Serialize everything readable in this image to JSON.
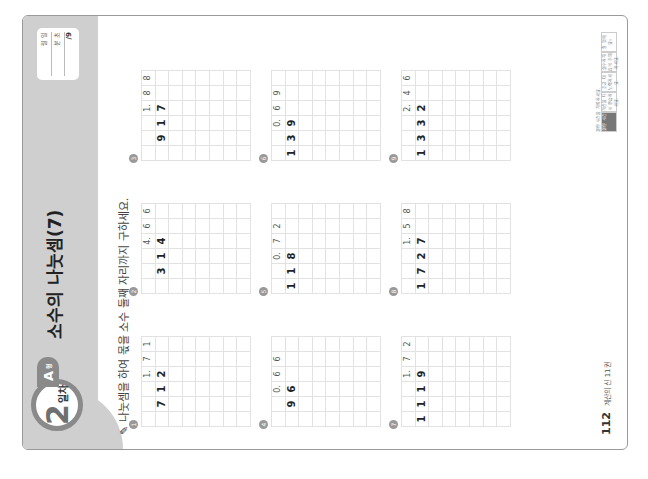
{
  "header": {
    "day_number": "2",
    "day_label": "일차",
    "type_letter": "A",
    "type_suffix": "형",
    "title": "소수의 나눗셈(7)",
    "scorebox": {
      "date_label": "월   일",
      "time_label": "분   초",
      "score": "/9"
    }
  },
  "instruction": "나눗셈을 하여 몫을 소수 둘째 자리까지 구하세요.",
  "problems": [
    {
      "number": "1",
      "divisor": "7",
      "dividend": "12",
      "quotient": "1.71",
      "work": [
        "1. 7 1",
        "7)1 2",
        "  7",
        "  5 0",
        "  4 9",
        "    1 0",
        "      7",
        "      3"
      ]
    },
    {
      "number": "2",
      "divisor": "3",
      "dividend": "14",
      "quotient": "4.66",
      "work": [
        "4. 6 6",
        "3)1 4",
        "1 2",
        "  2 0",
        "  1 8",
        "    2 0",
        "    1 8",
        "      2"
      ]
    },
    {
      "number": "3",
      "divisor": "9",
      "dividend": "17",
      "quotient": "1.88",
      "work": [
        "1. 8 8",
        "9)1 7",
        "  9",
        "  8 0",
        "  7 2",
        "    8 0",
        "    7 2",
        "      8"
      ]
    },
    {
      "number": "4",
      "divisor": "9",
      "dividend": "6",
      "quotient": "0.66",
      "work": [
        "0. 6 6",
        "9)6",
        "5 4",
        "  6 0",
        "  5 4",
        "    6"
      ]
    },
    {
      "number": "5",
      "divisor": "11",
      "dividend": "8",
      "quotient": "0.72",
      "work": [
        "0. 7 2",
        "11)8",
        "7 7",
        "  3 0",
        "  2 2",
        "    8"
      ]
    },
    {
      "number": "6",
      "divisor": "13",
      "dividend": "9",
      "quotient": "0.69",
      "work": [
        "0. 6 9",
        "13)9",
        "7 8",
        "1 2 0",
        "1 1 7",
        "    3"
      ]
    },
    {
      "number": "7",
      "divisor": "11",
      "dividend": "19",
      "quotient": "1.72",
      "work": [
        "1. 7 2",
        "11)1 9",
        "1 1",
        "  8 0",
        "  7 7",
        "    3 0",
        "    2 2",
        "      8"
      ]
    },
    {
      "number": "8",
      "divisor": "17",
      "dividend": "27",
      "quotient": "1.58",
      "work": [
        "1. 5 8",
        "17)2 7",
        "1 7",
        "1 0 0",
        "  8 5",
        "  1 5 0",
        "  1 3 6",
        "    1 4"
      ]
    },
    {
      "number": "9",
      "divisor": "13",
      "dividend": "32",
      "quotient": "2.46",
      "work": [
        "2. 4 6",
        "13)3 2",
        "2 6",
        "  6 0",
        "  5 2",
        "    8 0",
        "    7 8",
        "      2"
      ]
    }
  ],
  "footer": {
    "page_number": "112",
    "book_title": "계산의 신 11권"
  },
  "legend": {
    "caption": "걸린 시간을 기록하세요.",
    "cells": [
      "걸린 시간",
      "계산을 다시 연습하세요.",
      "조금 더 노력하세요.",
      "실수하지 않게 주의하세요.",
      "잘 했어요!"
    ]
  }
}
